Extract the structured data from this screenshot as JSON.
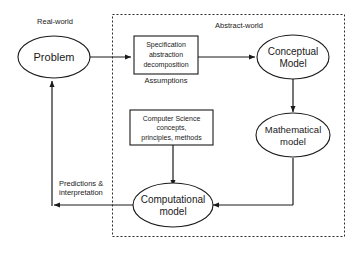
{
  "diagram": {
    "regions": [
      {
        "id": "real-world",
        "label": "Real-world"
      },
      {
        "id": "abstract-world",
        "label": "Abstract-world"
      }
    ],
    "nodes": [
      {
        "id": "problem",
        "shape": "ellipse",
        "lines": [
          "Problem"
        ]
      },
      {
        "id": "specification",
        "shape": "rect",
        "lines": [
          "Specification",
          "abstraction",
          "decomposition"
        ]
      },
      {
        "id": "conceptual-model",
        "shape": "ellipse",
        "lines": [
          "Conceptual",
          "Model"
        ]
      },
      {
        "id": "mathematical-model",
        "shape": "ellipse",
        "lines": [
          "Mathematical",
          "model"
        ]
      },
      {
        "id": "computer-science",
        "shape": "rect",
        "lines": [
          "Computer Science",
          "concepts,",
          "principles, methods"
        ]
      },
      {
        "id": "computational-model",
        "shape": "ellipse",
        "lines": [
          "Computational",
          "model"
        ]
      }
    ],
    "edge_labels": [
      {
        "id": "assumptions",
        "lines": [
          "Assumptions"
        ]
      },
      {
        "id": "predictions",
        "lines": [
          "Predictions &",
          "interpretation"
        ]
      }
    ],
    "colors": {
      "stroke": "#1a1a1a",
      "text": "#1a1a1a",
      "background": "#ffffff",
      "region_border": "#2a2a2a"
    }
  },
  "node_text": {
    "problem_1": "Problem",
    "specification_1": "Specification",
    "specification_2": "abstraction",
    "specification_3": "decomposition",
    "conceptual_1": "Conceptual",
    "conceptual_2": "Model",
    "mathematical_1": "Mathematical",
    "mathematical_2": "model",
    "compsci_1": "Computer Science",
    "compsci_2": "concepts,",
    "compsci_3": "principles, methods",
    "computational_1": "Computational",
    "computational_2": "model"
  },
  "labels": {
    "real_world": "Real-world",
    "abstract_world": "Abstract-world",
    "assumptions": "Assumptions",
    "predictions_1": "Predictions &",
    "predictions_2": "interpretation"
  }
}
